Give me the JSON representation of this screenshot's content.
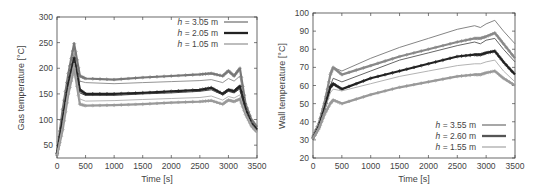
{
  "chart_data": [
    {
      "type": "line",
      "title": "",
      "xlabel": "Time [s]",
      "ylabel": "Gas temperature [°C]",
      "xlim": [
        0,
        3500
      ],
      "ylim": [
        25,
        300
      ],
      "xticks": [
        0,
        500,
        1000,
        1500,
        2000,
        2500,
        3000,
        3500
      ],
      "yticks": [
        50,
        100,
        150,
        200,
        250,
        300
      ],
      "grid": false,
      "legend_position": "upper right",
      "legend": [
        "h = 3.05 m",
        "h = 2.05 m",
        "h = 1.05 m"
      ],
      "x": [
        0,
        100,
        200,
        300,
        400,
        500,
        1000,
        1500,
        2000,
        2500,
        2700,
        2900,
        3000,
        3100,
        3200,
        3300,
        3400,
        3500
      ],
      "series": [
        {
          "name": "h = 3.05 m (measured, markers)",
          "color": "#777777",
          "values": [
            35,
            120,
            190,
            248,
            185,
            180,
            178,
            182,
            185,
            188,
            190,
            185,
            195,
            185,
            200,
            130,
            100,
            85
          ]
        },
        {
          "name": "h = 3.05 m (simulated)",
          "color": "#888888",
          "values": [
            35,
            110,
            180,
            230,
            175,
            172,
            170,
            172,
            174,
            176,
            178,
            172,
            180,
            175,
            185,
            125,
            95,
            80
          ]
        },
        {
          "name": "h = 2.05 m (measured, markers)",
          "color": "#222222",
          "values": [
            33,
            100,
            170,
            220,
            158,
            150,
            150,
            152,
            155,
            158,
            162,
            150,
            158,
            155,
            165,
            120,
            92,
            80
          ]
        },
        {
          "name": "h = 2.05 m (simulated)",
          "color": "#333333",
          "values": [
            33,
            95,
            165,
            215,
            152,
            147,
            147,
            150,
            152,
            155,
            158,
            148,
            155,
            152,
            160,
            115,
            90,
            78
          ]
        },
        {
          "name": "h = 1.05 m (measured, markers)",
          "color": "#999999",
          "values": [
            30,
            80,
            150,
            200,
            130,
            127,
            128,
            130,
            133,
            135,
            137,
            130,
            138,
            135,
            140,
            110,
            88,
            75
          ]
        },
        {
          "name": "h = 1.05 m (simulated)",
          "color": "#aaaaaa",
          "values": [
            30,
            90,
            160,
            210,
            140,
            136,
            137,
            139,
            141,
            143,
            146,
            138,
            145,
            142,
            148,
            112,
            88,
            76
          ]
        }
      ]
    },
    {
      "type": "line",
      "title": "",
      "xlabel": "Time [s]",
      "ylabel": "Wall temperature [°C]",
      "xlim": [
        0,
        3500
      ],
      "ylim": [
        20,
        100
      ],
      "xticks": [
        0,
        500,
        1000,
        1500,
        2000,
        2500,
        3000,
        3500
      ],
      "yticks": [
        20,
        30,
        40,
        50,
        60,
        70,
        80,
        90,
        100
      ],
      "grid": false,
      "legend_position": "lower right",
      "legend": [
        "h = 3.55 m",
        "h = 2.60 m",
        "h = 1.55 m"
      ],
      "x": [
        0,
        100,
        200,
        300,
        350,
        500,
        1000,
        1500,
        2000,
        2500,
        2800,
        2900,
        3000,
        3150,
        3300,
        3500
      ],
      "series": [
        {
          "name": "h = 3.55 m (simulated, upper)",
          "color": "#777777",
          "values": [
            32,
            40,
            52,
            65,
            70,
            68,
            75,
            81,
            86,
            91,
            93,
            92,
            94,
            96,
            90,
            83
          ]
        },
        {
          "name": "h = 3.55 m (measured, markers)",
          "color": "#888888",
          "values": [
            32,
            39,
            50,
            66,
            70,
            66,
            71,
            76,
            80,
            84,
            86,
            86,
            87,
            89,
            83,
            75
          ]
        },
        {
          "name": "h = 2.60 m (simulated)",
          "color": "#555555",
          "values": [
            31,
            38,
            48,
            60,
            64,
            62,
            68,
            74,
            78,
            82,
            84,
            83,
            85,
            86,
            80,
            73
          ]
        },
        {
          "name": "h = 2.60 m (measured, markers)",
          "color": "#222222",
          "values": [
            31,
            37,
            47,
            59,
            61,
            58,
            64,
            68,
            72,
            76,
            77,
            77,
            78,
            79,
            73,
            66
          ]
        },
        {
          "name": "h = 1.55 m (simulated)",
          "color": "#aaaaaa",
          "values": [
            31,
            37,
            46,
            56,
            58,
            57,
            61,
            65,
            68,
            71,
            72,
            72,
            73,
            74,
            68,
            62
          ]
        },
        {
          "name": "h = 1.55 m (measured, markers)",
          "color": "#999999",
          "values": [
            31,
            36,
            44,
            50,
            52,
            50,
            55,
            59,
            62,
            65,
            66,
            66,
            67,
            68,
            64,
            60
          ]
        }
      ]
    }
  ]
}
